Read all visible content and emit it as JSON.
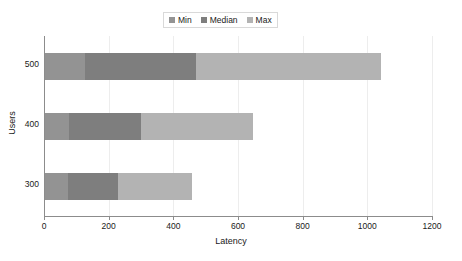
{
  "chart_data": {
    "type": "bar",
    "orientation": "horizontal",
    "stacked": true,
    "title": "",
    "xlabel": "Latency",
    "ylabel": "Users",
    "categories": [
      "500",
      "400",
      "300"
    ],
    "series": [
      {
        "name": "Min",
        "color": "#939393",
        "values": [
          127,
          77,
          74
        ]
      },
      {
        "name": "Median",
        "color": "#7e7e7e",
        "values": [
          470,
          300,
          229
        ]
      },
      {
        "name": "Max",
        "color": "#b3b3b3",
        "values": [
          1042,
          646,
          458
        ]
      }
    ],
    "xlim": [
      0,
      1200
    ],
    "xticks": [
      "0",
      "200",
      "400",
      "600",
      "800",
      "1000",
      "1200"
    ],
    "grid": true,
    "legend_position": "top-center"
  },
  "legend": {
    "items": [
      {
        "label": "Min"
      },
      {
        "label": "Median"
      },
      {
        "label": "Max"
      }
    ]
  },
  "axes": {
    "x_title": "Latency",
    "y_title": "Users"
  }
}
